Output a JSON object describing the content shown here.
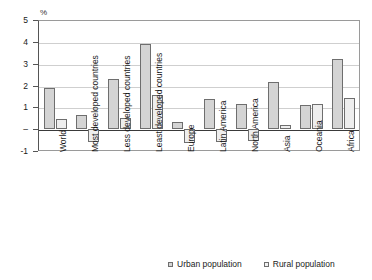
{
  "chart_data": {
    "type": "bar",
    "title": "",
    "subtitle": "",
    "xlabel": "",
    "ylabel": "%",
    "ylim": [
      -1,
      5
    ],
    "yticks": [
      "5",
      "4",
      "3",
      "2",
      "1",
      "–",
      "-1"
    ],
    "ytick_values": [
      5,
      4,
      3,
      2,
      1,
      0,
      -1
    ],
    "grid": true,
    "legend_position": "bottom",
    "categories": [
      "World",
      "Most developed countries",
      "Less developed countries",
      "Least developed countries",
      "Europe",
      "Latin America",
      "North America",
      "Asia",
      "Oceania",
      "Africa"
    ],
    "series": [
      {
        "name": "Urban population",
        "color": "#d4d4d4",
        "values": [
          1.9,
          0.65,
          2.3,
          3.9,
          0.35,
          1.4,
          1.15,
          2.15,
          1.1,
          3.2
        ]
      },
      {
        "name": "Rural population",
        "color": "#eeeeee",
        "values": [
          0.45,
          -0.6,
          0.5,
          1.55,
          -0.65,
          -0.6,
          -0.55,
          0.2,
          1.15,
          1.45
        ]
      }
    ]
  },
  "axis": {
    "unit_label": "%"
  },
  "legend": {
    "items": [
      {
        "label": "Urban population"
      },
      {
        "label": "Rural population"
      }
    ]
  }
}
